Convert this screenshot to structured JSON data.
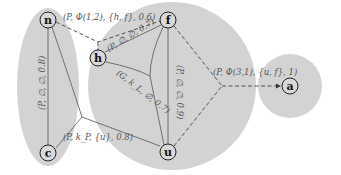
{
  "diagram": {
    "type": "graph",
    "regions": [
      {
        "id": "left-cluster",
        "contains": [
          "n",
          "c"
        ],
        "shape": "ellipse"
      },
      {
        "id": "center-cluster",
        "contains": [
          "h",
          "f",
          "u"
        ],
        "shape": "circle"
      },
      {
        "id": "right-cluster",
        "contains": [
          "a"
        ],
        "shape": "circle"
      }
    ],
    "nodes": {
      "n": {
        "label": "n"
      },
      "c": {
        "label": "c"
      },
      "h": {
        "label": "h"
      },
      "f": {
        "label": "f"
      },
      "u": {
        "label": "u"
      },
      "a": {
        "label": "a"
      }
    },
    "edges": {
      "n_c": {
        "from": "n",
        "to": "c",
        "style": "solid",
        "label": "(P, ∅, ∅, 0.8)"
      },
      "n_f": {
        "from": "n",
        "to": "f",
        "style": "dashed",
        "label": "(P, Φ(1,2), {h, f}, 0.6)"
      },
      "h_f": {
        "from": "h",
        "to": "f",
        "style": "solid",
        "label": "(P, ∅, ∅, 0.7)"
      },
      "f_u": {
        "from": "f",
        "to": "u",
        "style": "solid",
        "label": "(P, ∅, ∅, 0.9)"
      },
      "h_u": {
        "from": "h",
        "to": "u",
        "style": "solid",
        "label": "(G, k_L, ∅, 0.7)"
      },
      "c_u": {
        "from": "c",
        "to": "u",
        "style": "solid",
        "label": "(P, k_P, {u}, 0.8)"
      },
      "fu_a": {
        "from": "f,u",
        "to": "a",
        "style": "dashed",
        "arrow": true,
        "label": "(P, Φ(3,1), {u, f}, 1)"
      }
    }
  }
}
